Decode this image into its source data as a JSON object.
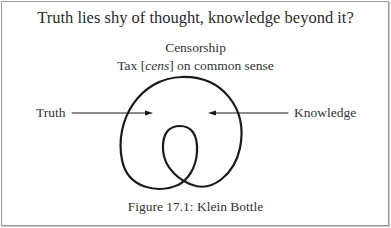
{
  "figure": {
    "title": "Truth lies shy of thought, knowledge beyond it?",
    "subtitle_line1": "Censorship",
    "subtitle_line2_prefix": "Tax [",
    "subtitle_line2_italic": "cens",
    "subtitle_line2_suffix": "] on common sense",
    "left_label": "Truth",
    "right_label": "Knowledge",
    "caption": "Figure 17.1: Klein Bottle",
    "diagram": {
      "shape": "klein-bottle-curve",
      "left_arrow": {
        "from": "Truth",
        "direction": "right"
      },
      "right_arrow": {
        "from": "Knowledge",
        "direction": "left"
      }
    },
    "colors": {
      "stroke": "#1a1a1a",
      "text": "#333333",
      "border": "#9a9a9a"
    }
  }
}
